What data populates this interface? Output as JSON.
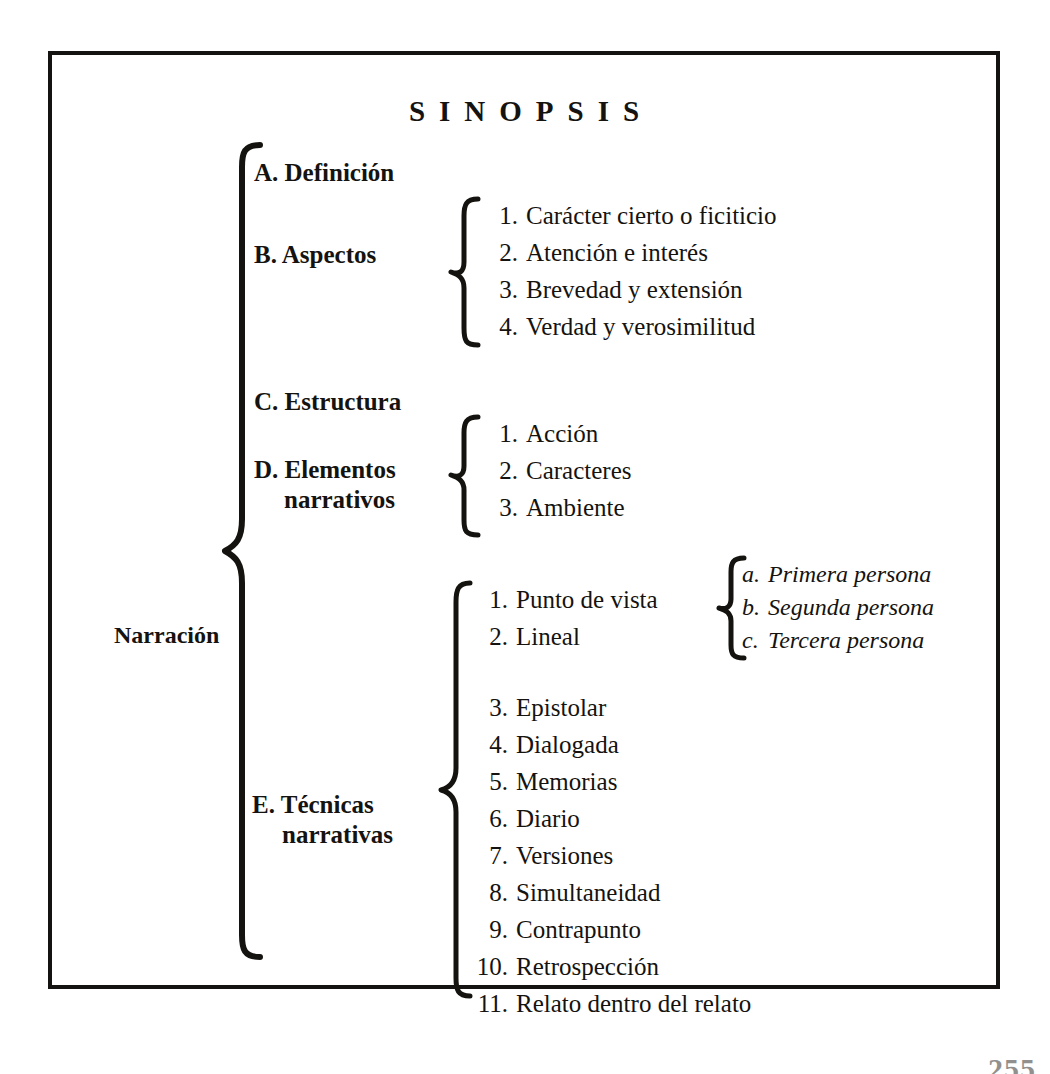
{
  "document": {
    "title": "SINOPSIS",
    "page_number": "255",
    "root_label": "Narración"
  },
  "branches": [
    {
      "id": "a",
      "label": "A. Definición",
      "label_line2": "",
      "children": []
    },
    {
      "id": "b",
      "label": "B. Aspectos",
      "label_line2": "",
      "children": [
        {
          "num": "1.",
          "text": "Carácter cierto o ficiticio"
        },
        {
          "num": "2.",
          "text": "Atención e interés"
        },
        {
          "num": "3.",
          "text": "Brevedad y extensión"
        },
        {
          "num": "4.",
          "text": "Verdad y verosimilitud"
        }
      ]
    },
    {
      "id": "c",
      "label": "C. Estructura",
      "label_line2": "",
      "children": []
    },
    {
      "id": "d",
      "label": "D. Elementos",
      "label_line2": "narrativos",
      "children": [
        {
          "num": "1.",
          "text": "Acción"
        },
        {
          "num": "2.",
          "text": "Caracteres"
        },
        {
          "num": "3.",
          "text": "Ambiente"
        }
      ]
    },
    {
      "id": "e",
      "label": "E. Técnicas",
      "label_line2": "narrativas",
      "children": [
        {
          "num": "1.",
          "text": "Punto de vista"
        },
        {
          "num": "2.",
          "text": "Lineal"
        },
        {
          "num": "3.",
          "text": "Epistolar"
        },
        {
          "num": "4.",
          "text": "Dialogada"
        },
        {
          "num": "5.",
          "text": "Memorias"
        },
        {
          "num": "6.",
          "text": "Diario"
        },
        {
          "num": "7.",
          "text": "Versiones"
        },
        {
          "num": "8.",
          "text": "Simultaneidad"
        },
        {
          "num": "9.",
          "text": "Contrapunto"
        },
        {
          "num": "10.",
          "text": "Retrospección"
        },
        {
          "num": "11.",
          "text": "Relato dentro del relato"
        }
      ]
    }
  ],
  "point_of_view_children": [
    {
      "num": "a.",
      "text": "Primera persona"
    },
    {
      "num": "b.",
      "text": "Segunda persona"
    },
    {
      "num": "c.",
      "text": "Tercera persona"
    }
  ],
  "colors": {
    "ink": "#15130f",
    "paper": "#ffffff"
  }
}
